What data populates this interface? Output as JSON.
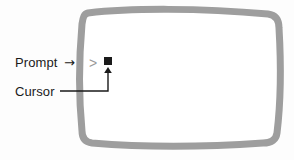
{
  "diagram": {
    "background_color": "#fdfdfd",
    "screen": {
      "name": "crt-screen-outline",
      "stroke_color": "#9e9e9e",
      "stroke_width": 7,
      "fill_color": "#ffffff"
    },
    "terminal": {
      "prompt_symbol": ">",
      "prompt_color": "#9a9a9a",
      "cursor_shape": "filled-square",
      "cursor_color": "#1a1a1a"
    },
    "annotations": [
      {
        "id": "prompt",
        "label": "Prompt",
        "arrow_glyph": "→",
        "connector": "arrow-glyph",
        "target": "prompt-symbol",
        "color": "#1a1a1a"
      },
      {
        "id": "cursor",
        "label": "Cursor",
        "arrow_glyph": "→",
        "connector": "elbow-leader-line",
        "target": "cursor-square",
        "color": "#1a1a1a"
      }
    ]
  }
}
